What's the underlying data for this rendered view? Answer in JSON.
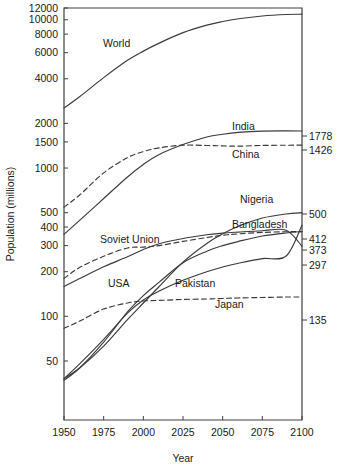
{
  "chart_data": {
    "type": "line",
    "title": "",
    "xlabel": "Year",
    "ylabel": "Population (millions)",
    "xlim": [
      1950,
      2100
    ],
    "ylim": [
      20,
      12000
    ],
    "yscale": "log",
    "grid": false,
    "legend_position": "inline-labels",
    "xticks": [
      1950,
      1975,
      2000,
      2025,
      2050,
      2075,
      2100
    ],
    "yticks": [
      50,
      100,
      200,
      300,
      400,
      500,
      1000,
      1500,
      2000,
      4000,
      6000,
      8000,
      10000,
      12000
    ],
    "ytick_labels": [
      "50",
      "100",
      "200",
      "300",
      "400",
      "500",
      "1000",
      "1500",
      "2000",
      "4000",
      "6000",
      "8000",
      "10000",
      "12000"
    ],
    "xtick_labels": [
      "1950",
      "1975",
      "2000",
      "2025",
      "2050",
      "2075",
      "2100"
    ],
    "x": [
      1950,
      1960,
      1975,
      1990,
      2000,
      2010,
      2025,
      2040,
      2050,
      2060,
      2075,
      2090,
      2100
    ],
    "series": [
      {
        "name": "World",
        "label": "World",
        "style": "solid",
        "end_label": "",
        "values": [
          2536,
          3035,
          4070,
          5327,
          6143,
          6957,
          8184,
          9200,
          9735,
          10150,
          10600,
          10850,
          10900
        ]
      },
      {
        "name": "India",
        "label": "India",
        "style": "solid",
        "end_label": "1778",
        "values": [
          357,
          445,
          623,
          870,
          1057,
          1234,
          1440,
          1620,
          1690,
          1740,
          1775,
          1780,
          1778
        ]
      },
      {
        "name": "China",
        "label": "China",
        "style": "dashed",
        "end_label": "1426",
        "values": [
          544,
          660,
          927,
          1176,
          1290,
          1369,
          1426,
          1420,
          1410,
          1405,
          1420,
          1425,
          1426
        ]
      },
      {
        "name": "Nigeria",
        "label": "Nigeria",
        "style": "solid",
        "end_label": "500",
        "values": [
          38,
          45,
          63,
          95,
          123,
          159,
          232,
          310,
          360,
          405,
          460,
          490,
          500
        ]
      },
      {
        "name": "Bangladesh",
        "label": "Bangladesh",
        "style": "solid",
        "end_label": "412",
        "values": [
          38,
          48,
          70,
          105,
          129,
          148,
          175,
          200,
          215,
          228,
          245,
          255,
          412
        ]
      },
      {
        "name": "Pakistan",
        "label": "Pakistan",
        "style": "solid",
        "end_label": "373",
        "values": [
          37,
          45,
          67,
          107,
          138,
          170,
          230,
          275,
          300,
          320,
          348,
          365,
          373
        ]
      },
      {
        "name": "USA",
        "label": "USA",
        "style": "solid",
        "end_label": "297",
        "values": [
          159,
          180,
          216,
          252,
          282,
          309,
          335,
          355,
          364,
          370,
          378,
          381,
          297
        ]
      },
      {
        "name": "Soviet Union",
        "label": "Soviet Union",
        "style": "dashed",
        "end_label": "373",
        "values": [
          180,
          214,
          254,
          289,
          293,
          300,
          320,
          340,
          352,
          360,
          368,
          372,
          373
        ]
      },
      {
        "name": "Japan",
        "label": "Japan",
        "style": "dashed",
        "end_label": "135",
        "values": [
          83,
          93,
          112,
          123,
          127,
          128,
          130,
          131,
          132,
          133,
          134,
          135,
          135
        ]
      }
    ],
    "inline_labels": [
      {
        "text": "World",
        "x_px": 103,
        "y_px": 47
      },
      {
        "text": "India",
        "x_px": 232,
        "y_px": 130
      },
      {
        "text": "China",
        "x_px": 232,
        "y_px": 158
      },
      {
        "text": "Nigeria",
        "x_px": 240,
        "y_px": 203
      },
      {
        "text": "Bangladesh",
        "x_px": 232,
        "y_px": 228
      },
      {
        "text": "Soviet Union",
        "x_px": 100,
        "y_px": 243
      },
      {
        "text": "USA",
        "x_px": 108,
        "y_px": 287
      },
      {
        "text": "Pakistan",
        "x_px": 175,
        "y_px": 287
      },
      {
        "text": "Japan",
        "x_px": 215,
        "y_px": 308
      }
    ],
    "end_labels": [
      {
        "text": "1778",
        "y_px": 136
      },
      {
        "text": "1426",
        "y_px": 150
      },
      {
        "text": "500",
        "y_px": 214
      },
      {
        "text": "412",
        "y_px": 239
      },
      {
        "text": "373",
        "y_px": 250
      },
      {
        "text": "297",
        "y_px": 265
      },
      {
        "text": "135",
        "y_px": 320
      }
    ]
  }
}
